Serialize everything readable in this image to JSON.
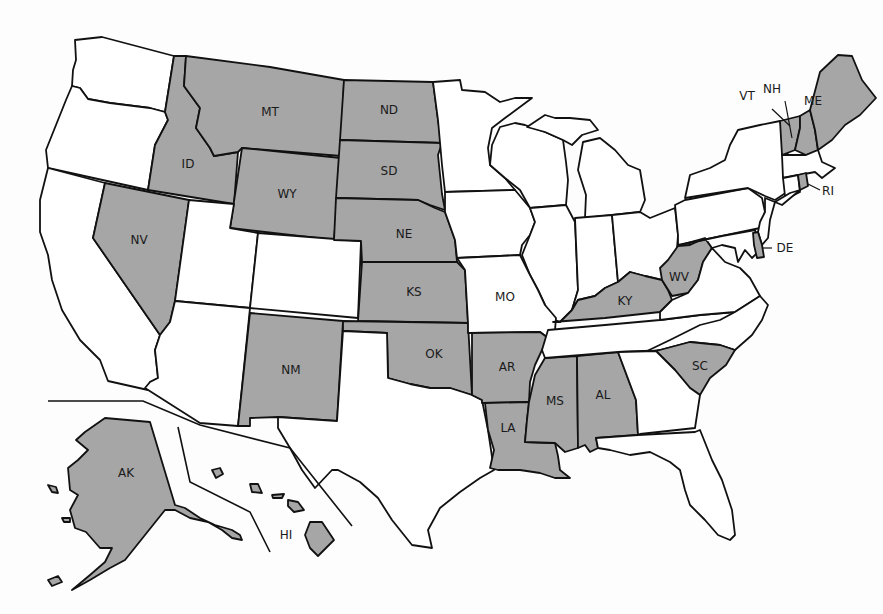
{
  "map": {
    "title": "",
    "colors": {
      "highlighted": "#a6a6a6",
      "default": "#ffffff",
      "border": "#111111",
      "background": "#fdfdfd"
    },
    "highlighted_states": [
      "MT",
      "ND",
      "ID",
      "WY",
      "SD",
      "NE",
      "NV",
      "KS",
      "NM",
      "OK",
      "AR",
      "LA",
      "MS",
      "AL",
      "KY",
      "WV",
      "SC",
      "VT",
      "NH",
      "ME",
      "RI",
      "DE",
      "AK",
      "HI"
    ],
    "labels": {
      "MT": "MT",
      "ND": "ND",
      "ID": "ID",
      "WY": "WY",
      "SD": "SD",
      "NE": "NE",
      "NV": "NV",
      "KS": "KS",
      "MO": "MO",
      "NM": "NM",
      "OK": "OK",
      "AR": "AR",
      "LA": "LA",
      "MS": "MS",
      "AL": "AL",
      "KY": "KY",
      "WV": "WV",
      "SC": "SC",
      "VT": "VT",
      "NH": "NH",
      "ME": "ME",
      "RI": "RI",
      "DE": "DE",
      "AK": "AK",
      "HI": "HI"
    },
    "states": [
      {
        "abbr": "WA",
        "highlighted": false
      },
      {
        "abbr": "OR",
        "highlighted": false
      },
      {
        "abbr": "CA",
        "highlighted": false
      },
      {
        "abbr": "ID",
        "highlighted": true
      },
      {
        "abbr": "NV",
        "highlighted": true
      },
      {
        "abbr": "MT",
        "highlighted": true
      },
      {
        "abbr": "WY",
        "highlighted": true
      },
      {
        "abbr": "UT",
        "highlighted": false
      },
      {
        "abbr": "AZ",
        "highlighted": false
      },
      {
        "abbr": "CO",
        "highlighted": false
      },
      {
        "abbr": "NM",
        "highlighted": true
      },
      {
        "abbr": "ND",
        "highlighted": true
      },
      {
        "abbr": "SD",
        "highlighted": true
      },
      {
        "abbr": "NE",
        "highlighted": true
      },
      {
        "abbr": "KS",
        "highlighted": true
      },
      {
        "abbr": "OK",
        "highlighted": true
      },
      {
        "abbr": "TX",
        "highlighted": false
      },
      {
        "abbr": "MN",
        "highlighted": false
      },
      {
        "abbr": "IA",
        "highlighted": false
      },
      {
        "abbr": "MO",
        "highlighted": false
      },
      {
        "abbr": "AR",
        "highlighted": true
      },
      {
        "abbr": "LA",
        "highlighted": true
      },
      {
        "abbr": "WI",
        "highlighted": false
      },
      {
        "abbr": "IL",
        "highlighted": false
      },
      {
        "abbr": "MS",
        "highlighted": true
      },
      {
        "abbr": "MI",
        "highlighted": false
      },
      {
        "abbr": "IN",
        "highlighted": false
      },
      {
        "abbr": "KY",
        "highlighted": true
      },
      {
        "abbr": "TN",
        "highlighted": false
      },
      {
        "abbr": "AL",
        "highlighted": true
      },
      {
        "abbr": "OH",
        "highlighted": false
      },
      {
        "abbr": "WV",
        "highlighted": true
      },
      {
        "abbr": "GA",
        "highlighted": false
      },
      {
        "abbr": "FL",
        "highlighted": false
      },
      {
        "abbr": "SC",
        "highlighted": true
      },
      {
        "abbr": "NC",
        "highlighted": false
      },
      {
        "abbr": "VA",
        "highlighted": false
      },
      {
        "abbr": "PA",
        "highlighted": false
      },
      {
        "abbr": "NY",
        "highlighted": false
      },
      {
        "abbr": "MD",
        "highlighted": false
      },
      {
        "abbr": "DE",
        "highlighted": true
      },
      {
        "abbr": "NJ",
        "highlighted": false
      },
      {
        "abbr": "CT",
        "highlighted": false
      },
      {
        "abbr": "RI",
        "highlighted": true
      },
      {
        "abbr": "MA",
        "highlighted": false
      },
      {
        "abbr": "VT",
        "highlighted": true
      },
      {
        "abbr": "NH",
        "highlighted": true
      },
      {
        "abbr": "ME",
        "highlighted": true
      },
      {
        "abbr": "AK",
        "highlighted": true
      },
      {
        "abbr": "HI",
        "highlighted": true
      }
    ]
  }
}
